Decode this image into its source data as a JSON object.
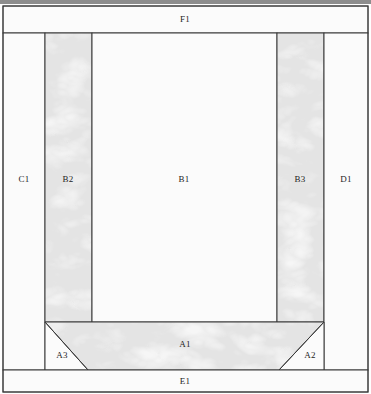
{
  "diagram": {
    "canvas": {
      "width": 371,
      "height": 394
    },
    "colors": {
      "speckle_fill": "#f1f1f1",
      "speckle_fill_alt": "#fbfbfb",
      "hatched_fill": "#d6d6d6",
      "hatched_fill_alt": "#dedede",
      "contour_line": "#ececec",
      "stroke": "#3a3a3a",
      "label_text": "#232323",
      "top_band": "#8d8d8d"
    },
    "stroke_width": 1,
    "regions": [
      {
        "id": "F1",
        "label": "F1",
        "fill": "speckle",
        "shape": "rect",
        "x": 3,
        "y": 6,
        "width": 365,
        "height": 27,
        "label_x": 185,
        "label_y": 20
      },
      {
        "id": "C1",
        "label": "C1",
        "fill": "speckle",
        "shape": "rect",
        "x": 3,
        "y": 33,
        "width": 42,
        "height": 337,
        "label_x": 24,
        "label_y": 180
      },
      {
        "id": "B2",
        "label": "B2",
        "fill": "hatched",
        "shape": "rect",
        "x": 45,
        "y": 33,
        "width": 47,
        "height": 289,
        "label_x": 68,
        "label_y": 180
      },
      {
        "id": "B1",
        "label": "B1",
        "fill": "speckle",
        "shape": "rect",
        "x": 92,
        "y": 33,
        "width": 185,
        "height": 289,
        "label_x": 184,
        "label_y": 180
      },
      {
        "id": "B3",
        "label": "B3",
        "fill": "hatched",
        "shape": "rect",
        "x": 277,
        "y": 33,
        "width": 47,
        "height": 289,
        "label_x": 300,
        "label_y": 180
      },
      {
        "id": "D1",
        "label": "D1",
        "fill": "speckle",
        "shape": "rect",
        "x": 324,
        "y": 33,
        "width": 44,
        "height": 337,
        "label_x": 346,
        "label_y": 180
      },
      {
        "id": "A1",
        "label": "A1",
        "fill": "hatched",
        "shape": "trapezoid",
        "points": "45,322 324,322 279,370 88,370",
        "label_x": 185,
        "label_y": 345
      },
      {
        "id": "A3",
        "label": "A3",
        "fill": "speckle",
        "shape": "triangle",
        "points": "45,322 88,370 45,370",
        "label_x": 62,
        "label_y": 356
      },
      {
        "id": "A2",
        "label": "A2",
        "fill": "speckle",
        "shape": "triangle",
        "points": "324,322 324,370 279,370",
        "label_x": 310,
        "label_y": 356
      },
      {
        "id": "E1",
        "label": "E1",
        "fill": "speckle",
        "shape": "rect",
        "x": 3,
        "y": 370,
        "width": 365,
        "height": 22,
        "label_x": 185,
        "label_y": 382
      }
    ],
    "outline": {
      "x": 3,
      "y": 6,
      "width": 365,
      "height": 386
    }
  }
}
